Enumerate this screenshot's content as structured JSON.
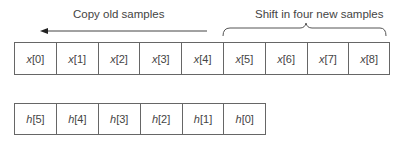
{
  "labels": {
    "copy": "Copy old samples",
    "shift": "Shift in four new samples"
  },
  "x_buffer": [
    {
      "var": "x",
      "idx": "[0]"
    },
    {
      "var": "x",
      "idx": "[1]"
    },
    {
      "var": "x",
      "idx": "[2]"
    },
    {
      "var": "x",
      "idx": "[3]"
    },
    {
      "var": "x",
      "idx": "[4]"
    },
    {
      "var": "x",
      "idx": "[5]"
    },
    {
      "var": "x",
      "idx": "[6]"
    },
    {
      "var": "x",
      "idx": "[7]"
    },
    {
      "var": "x",
      "idx": "[8]"
    }
  ],
  "h_coeffs": [
    {
      "var": "h",
      "idx": "[5]"
    },
    {
      "var": "h",
      "idx": "[4]"
    },
    {
      "var": "h",
      "idx": "[3]"
    },
    {
      "var": "h",
      "idx": "[2]"
    },
    {
      "var": "h",
      "idx": "[1]"
    },
    {
      "var": "h",
      "idx": "[0]"
    }
  ]
}
